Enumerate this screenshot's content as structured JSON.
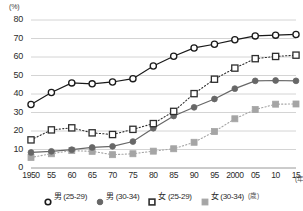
{
  "chart_data": {
    "type": "line",
    "title": "",
    "xlabel": "年",
    "ylabel": "(%)",
    "ylim": [
      0,
      80
    ],
    "ytick_step": 10,
    "grid": true,
    "legend_position": "bottom",
    "categories": [
      "1950",
      "55",
      "60",
      "65",
      "70",
      "75",
      "80",
      "85",
      "90",
      "95",
      "2000",
      "05",
      "10",
      "15"
    ],
    "yticks": [
      "0",
      "10",
      "20",
      "30",
      "40",
      "50",
      "60",
      "70",
      "80"
    ],
    "series": [
      {
        "name": "男 (25-29)",
        "marker": "open-circle",
        "line_style": "solid",
        "color": "#1a1a1a",
        "values": [
          34.3,
          40.8,
          46.0,
          45.5,
          46.5,
          48.3,
          55.1,
          60.4,
          64.9,
          66.9,
          69.3,
          71.4,
          71.8,
          72.2
        ]
      },
      {
        "name": "男 (30-34)",
        "marker": "filled-circle",
        "line_style": "solid",
        "color": "#676767",
        "values": [
          8.4,
          9.0,
          9.9,
          11.1,
          11.7,
          14.3,
          21.5,
          28.1,
          32.8,
          37.3,
          42.9,
          47.1,
          47.3,
          47.1
        ]
      },
      {
        "name": "女 (25-29)",
        "marker": "open-square",
        "line_style": "dotted",
        "color": "#2e2e2e",
        "values": [
          15.2,
          20.6,
          21.7,
          19.0,
          18.1,
          20.9,
          24.0,
          30.6,
          40.2,
          48.0,
          54.0,
          59.1,
          60.3,
          61.0
        ]
      },
      {
        "name": "女 (30-34)",
        "marker": "filled-square",
        "line_style": "dotted",
        "color": "#a5a5a5",
        "values": [
          5.7,
          7.7,
          9.4,
          9.0,
          7.2,
          7.7,
          9.1,
          10.4,
          13.9,
          19.7,
          26.6,
          31.6,
          34.5,
          34.6
        ]
      }
    ]
  },
  "axis": {
    "unit_label": "(%)",
    "x_unit_label": "(年)"
  },
  "legend": {
    "items": [
      {
        "label": "男 (25-29)",
        "marker": "open-circle-icon",
        "color": "#1a1a1a"
      },
      {
        "label": "男 (30-34)",
        "marker": "filled-circle-icon",
        "color": "#676767"
      },
      {
        "label": "女 (25-29)",
        "marker": "open-square-icon",
        "color": "#2e2e2e"
      },
      {
        "label": "女 (30-34)",
        "marker": "filled-square-icon",
        "color": "#a5a5a5"
      }
    ],
    "unit": "(歳)"
  }
}
